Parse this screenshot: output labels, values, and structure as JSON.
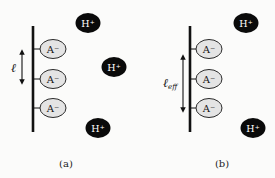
{
  "colors": {
    "background": "#fbfbfa",
    "line": "#111111",
    "anion_fill": "#e4e4e4",
    "anion_stroke": "#2a2a2a",
    "cation_fill": "#0a0a0a",
    "cation_text": "#ffffff"
  },
  "panels": [
    {
      "id": "a",
      "caption": "(a)",
      "length_label": "ℓ",
      "length_sub": "",
      "anion_label": "A⁻",
      "cation_label": "H⁺",
      "anion_count": 3,
      "cation_count": 3
    },
    {
      "id": "b",
      "caption": "(b)",
      "length_label": "ℓ",
      "length_sub": "eff",
      "anion_label": "A⁻",
      "cation_label": "H⁺",
      "anion_count": 3,
      "cation_count": 2
    }
  ]
}
